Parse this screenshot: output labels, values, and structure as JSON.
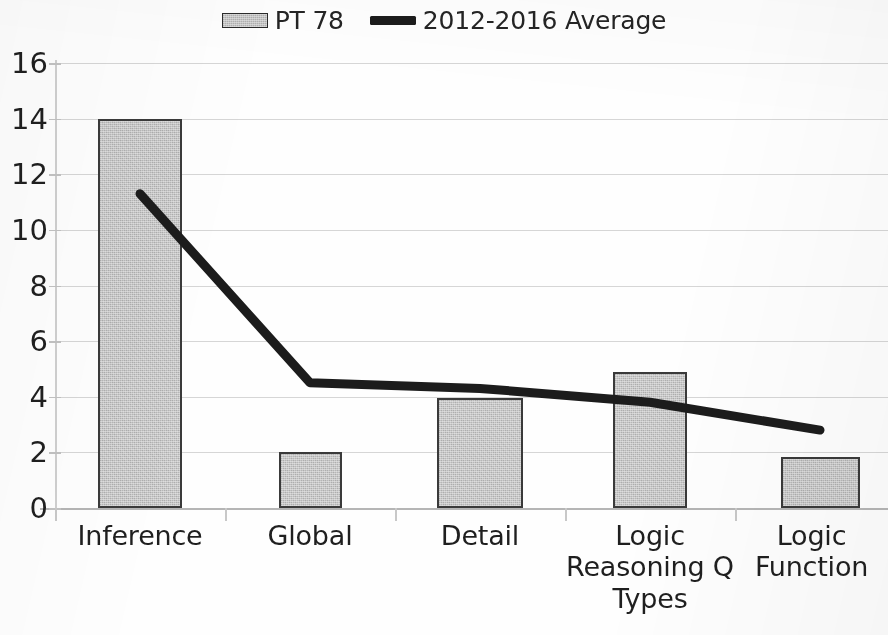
{
  "legend": {
    "entries": [
      {
        "label": "PT 78",
        "type": "bar",
        "color": "#c6c6c6"
      },
      {
        "label": "2012-2016 Average",
        "type": "line",
        "color": "#1c1c1c"
      }
    ]
  },
  "axes": {
    "y_ticks": [
      "16",
      "14",
      "12",
      "10",
      "8",
      "6",
      "4",
      "2",
      "0"
    ],
    "x_categories": [
      [
        "Inference"
      ],
      [
        "Global"
      ],
      [
        "Detail"
      ],
      [
        "Logic",
        "Reasoning Q",
        "Types"
      ],
      [
        "Logic",
        "Function"
      ]
    ]
  },
  "chart_data": {
    "type": "bar",
    "title": "",
    "xlabel": "",
    "ylabel": "",
    "ylim": [
      0,
      16
    ],
    "ytick_step": 2,
    "grid": true,
    "legend_position": "top-center",
    "categories": [
      "Inference",
      "Global",
      "Detail",
      "Logic Reasoning Q Types",
      "Logic Function"
    ],
    "series": [
      {
        "name": "PT 78",
        "type": "bar",
        "color": "#c6c6c6",
        "values": [
          14.0,
          2.0,
          3.95,
          4.9,
          1.85
        ]
      },
      {
        "name": "2012-2016 Average",
        "type": "line",
        "color": "#1c1c1c",
        "values": [
          11.3,
          4.5,
          4.3,
          3.8,
          2.8
        ]
      }
    ]
  }
}
